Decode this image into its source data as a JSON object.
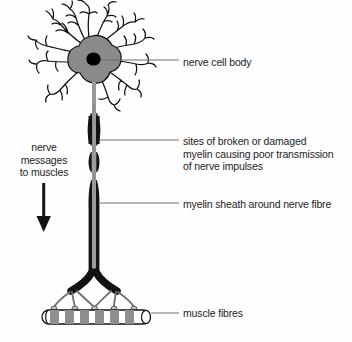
{
  "diagram": {
    "background_color": "#fefefe",
    "stroke_color": "#111111",
    "soma_fill": "#8a8a8a",
    "nucleus_fill": "#000000",
    "myelin_fill": "#121212",
    "fibre_core_color": "#9a9a9a",
    "muscle_band_fill": "#8e8e8e",
    "leader_line_color": "#707070",
    "text_color": "#1d1d1d"
  },
  "labels": {
    "nerve_cell_body": "nerve cell body",
    "damaged_myelin": "sites of broken or damaged\nmyelin causing poor transmission\nof nerve impulses",
    "myelin_sheath": "myelin sheath around nerve fibre",
    "muscle_fibres": "muscle fibres",
    "nerve_messages": "nerve\nmessages\nto muscles"
  },
  "caption": "",
  "parts": {
    "dendrites": "dendrites",
    "soma": "nerve-cell-body",
    "nucleus": "nucleus",
    "axon": "nerve-fibre",
    "myelin_segments": "myelin-sheath-segments",
    "damage_gaps": "broken-myelin-gaps",
    "axon_terminals": "axon-terminal-branches",
    "muscle_fibre_bar": "muscle-fibre"
  },
  "direction_arrow": {
    "name": "downward-arrow",
    "direction": "down"
  }
}
